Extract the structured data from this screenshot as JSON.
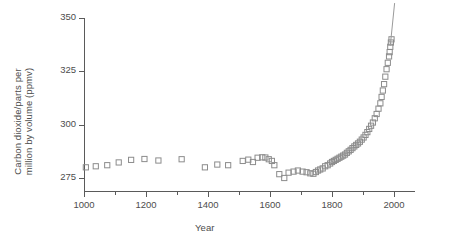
{
  "chart_data": {
    "type": "scatter",
    "title": "",
    "xlabel": "Year",
    "ylabel": "Carbon dioxide/parts per\nmillion by volume (ppmv)",
    "xlim": [
      1000,
      2000
    ],
    "ylim": [
      270,
      352
    ],
    "xticks": [
      1000,
      1200,
      1400,
      1600,
      1800,
      2000
    ],
    "xtick_labels": [
      "1000",
      "1200",
      "1400",
      "1600",
      "1800",
      "2000"
    ],
    "yticks": [
      275,
      300,
      325,
      350
    ],
    "ytick_labels": [
      "275",
      "300",
      "325",
      "350"
    ],
    "x_minor_ticks": [
      1100,
      1300,
      1500,
      1700,
      1900
    ],
    "grid": false,
    "legend": null,
    "marker_style": "open-square",
    "marker_color": "#8c8c8c",
    "axis_color": "#5a5a5a",
    "text_color": "#4d4d4d",
    "background": "#ffffff",
    "series": [
      {
        "name": "Ice core CO2 record",
        "marker": "open-square",
        "points": [
          [
            1006,
            280.0
          ],
          [
            1038,
            280.5
          ],
          [
            1075,
            281.0
          ],
          [
            1112,
            282.3
          ],
          [
            1152,
            283.5
          ],
          [
            1195,
            283.9
          ],
          [
            1240,
            283.2
          ],
          [
            1315,
            283.8
          ],
          [
            1390,
            280.0
          ],
          [
            1430,
            281.3
          ],
          [
            1465,
            281.0
          ],
          [
            1512,
            283.0
          ],
          [
            1530,
            283.6
          ],
          [
            1545,
            282.5
          ],
          [
            1560,
            284.5
          ],
          [
            1575,
            284.7
          ],
          [
            1585,
            284.6
          ],
          [
            1596,
            283.8
          ],
          [
            1606,
            283.0
          ],
          [
            1614,
            281.0
          ],
          [
            1630,
            276.8
          ],
          [
            1646,
            275.0
          ],
          [
            1660,
            277.5
          ],
          [
            1676,
            278.0
          ],
          [
            1690,
            278.5
          ],
          [
            1705,
            278.0
          ],
          [
            1718,
            277.7
          ],
          [
            1730,
            277.2
          ],
          [
            1740,
            277.0
          ],
          [
            1748,
            277.8
          ],
          [
            1755,
            278.5
          ],
          [
            1762,
            279.0
          ],
          [
            1770,
            279.5
          ],
          [
            1778,
            280.5
          ],
          [
            1786,
            281.0
          ],
          [
            1794,
            281.8
          ],
          [
            1800,
            282.5
          ],
          [
            1806,
            283.0
          ],
          [
            1812,
            283.5
          ],
          [
            1818,
            284.0
          ],
          [
            1824,
            284.5
          ],
          [
            1830,
            285.0
          ],
          [
            1836,
            285.5
          ],
          [
            1842,
            286.0
          ],
          [
            1848,
            286.8
          ],
          [
            1854,
            287.5
          ],
          [
            1860,
            288.2
          ],
          [
            1866,
            289.0
          ],
          [
            1872,
            289.8
          ],
          [
            1878,
            290.5
          ],
          [
            1884,
            291.2
          ],
          [
            1890,
            292.0
          ],
          [
            1896,
            293.0
          ],
          [
            1902,
            294.0
          ],
          [
            1908,
            295.2
          ],
          [
            1914,
            296.5
          ],
          [
            1920,
            298.0
          ],
          [
            1926,
            299.5
          ],
          [
            1932,
            301.0
          ],
          [
            1938,
            303.0
          ],
          [
            1944,
            305.0
          ],
          [
            1950,
            307.5
          ],
          [
            1956,
            310.0
          ],
          [
            1960,
            313.0
          ],
          [
            1964,
            316.0
          ],
          [
            1968,
            319.0
          ],
          [
            1972,
            322.5
          ],
          [
            1976,
            326.0
          ],
          [
            1980,
            329.0
          ],
          [
            1984,
            332.0
          ],
          [
            1986,
            334.0
          ],
          [
            1988,
            336.5
          ],
          [
            1990,
            338.5
          ],
          [
            1992,
            340.0
          ]
        ]
      }
    ],
    "annotations": [
      {
        "type": "line",
        "name": "modern-record-line",
        "description": "thin line rising steeply from the last data cluster to the top of the plot",
        "from": [
          1988,
          337.0
        ],
        "to": [
          2002,
          357.0
        ]
      }
    ]
  },
  "axis": {
    "x_label": "Year",
    "y_label_line1": "Carbon dioxide/parts per",
    "y_label_line2": "million by volume (ppmv)"
  }
}
